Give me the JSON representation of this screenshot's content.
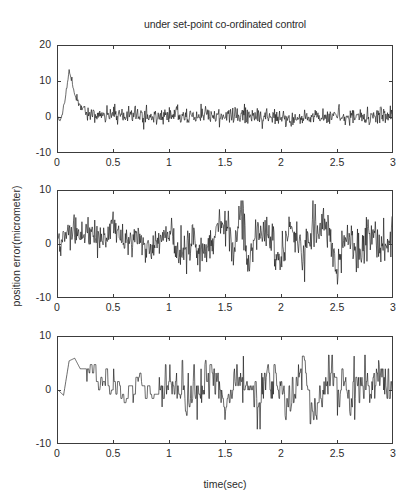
{
  "chart_data": {
    "type": "line",
    "title": "under set-point co-ordinated control",
    "xlabel": "time(sec)",
    "ylabel": "position error(micrometer)",
    "grid": false,
    "legend": "none",
    "xlim": [
      0,
      3
    ],
    "xticks": [
      "0",
      "0.5",
      "1",
      "1.5",
      "2",
      "2.5",
      "3"
    ],
    "xtick_values": [
      0,
      0.5,
      1,
      1.5,
      2,
      2.5,
      3
    ],
    "panels": [
      {
        "index": 1,
        "name": "axis-1",
        "ylim": [
          -10,
          20
        ],
        "yticks": [
          "20",
          "10",
          "0",
          "-10"
        ],
        "ytick_values": [
          20,
          10,
          0,
          -10
        ],
        "description": "initial transient spike to about 13 micrometer near t=0.1 s, decaying to low-amplitude noise about 0 with range roughly -3 to +3",
        "series": [
          {
            "name": "position error axis 1",
            "peak_value": 13,
            "peak_time": 0.1,
            "steady_mean": 0,
            "steady_band": [
              -3,
              3
            ],
            "x": [
              0,
              0.02,
              0.04,
              0.06,
              0.08,
              0.1,
              0.12,
              0.14,
              0.16,
              0.18,
              0.2,
              0.25,
              0.3,
              0.4,
              0.5,
              0.6,
              0.7,
              0.8,
              0.9,
              1.0,
              1.1,
              1.2,
              1.3,
              1.4,
              1.5,
              1.6,
              1.7,
              1.8,
              1.9,
              2.0,
              2.1,
              2.2,
              2.3,
              2.4,
              2.5,
              2.6,
              2.7,
              2.8,
              2.9,
              3.0
            ],
            "values": [
              0,
              -1.5,
              1.0,
              4.5,
              8.5,
              13.0,
              10.5,
              8.0,
              6.0,
              4.5,
              3.0,
              1.0,
              0.5,
              0.2,
              0.6,
              0.1,
              0.8,
              0.0,
              0.4,
              0.3,
              0.7,
              -0.2,
              0.5,
              0.1,
              0.9,
              -0.1,
              0.4,
              -0.6,
              -0.3,
              -0.8,
              -0.2,
              -0.4,
              0.2,
              -0.5,
              0.6,
              -0.3,
              0.1,
              -0.4,
              1.2,
              0.3
            ]
          }
        ]
      },
      {
        "index": 2,
        "name": "axis-2",
        "ylim": [
          -10,
          10
        ],
        "yticks": [
          "10",
          "0",
          "-10"
        ],
        "ytick_values": [
          10,
          0,
          -10
        ],
        "description": "broadband noise about 0 micrometer, amplitude growing from roughly +/-3 early to roughly +/-5 after t=1.2 s, with a tall spike near t=1.65 s reaching about 8",
        "series": [
          {
            "name": "position error axis 2",
            "mean": 0,
            "early_band": [
              -3,
              3
            ],
            "late_band": [
              -5,
              5
            ],
            "spike_value": 8,
            "spike_time": 1.65,
            "x": [
              0,
              0.1,
              0.2,
              0.3,
              0.4,
              0.5,
              0.6,
              0.7,
              0.8,
              0.9,
              1.0,
              1.1,
              1.2,
              1.3,
              1.4,
              1.5,
              1.6,
              1.65,
              1.7,
              1.8,
              1.9,
              2.0,
              2.1,
              2.2,
              2.3,
              2.4,
              2.5,
              2.6,
              2.7,
              2.8,
              2.9,
              3.0
            ],
            "values": [
              0,
              3.0,
              1.5,
              2.0,
              1.0,
              2.5,
              0.5,
              1.5,
              -1.0,
              1.0,
              2.0,
              -1.5,
              0.5,
              -2.0,
              1.0,
              3.0,
              -1.0,
              8.0,
              -4.0,
              2.0,
              1.0,
              -2.5,
              3.5,
              -3.0,
              2.0,
              4.0,
              -5.0,
              1.5,
              -2.0,
              3.0,
              -1.0,
              0.5
            ]
          }
        ]
      },
      {
        "index": 3,
        "name": "axis-3",
        "ylim": [
          -10,
          10
        ],
        "yticks": [
          "10",
          "0",
          "-10"
        ],
        "ytick_values": [
          10,
          0,
          -10
        ],
        "description": "quantized stepped signal, initial step up to about 6 micrometer near t=0.1 s, then stepped noise about 0 with range roughly -7 to +6",
        "series": [
          {
            "name": "position error axis 3",
            "initial_step_value": 6,
            "initial_step_time": 0.12,
            "mean": 0,
            "band": [
              -7,
              6
            ],
            "x": [
              0,
              0.05,
              0.1,
              0.15,
              0.2,
              0.3,
              0.4,
              0.5,
              0.6,
              0.7,
              0.8,
              0.9,
              1.0,
              1.1,
              1.2,
              1.3,
              1.4,
              1.5,
              1.6,
              1.7,
              1.8,
              1.9,
              2.0,
              2.1,
              2.2,
              2.3,
              2.4,
              2.5,
              2.6,
              2.7,
              2.8,
              2.9,
              3.0
            ],
            "values": [
              0,
              -1.0,
              5.5,
              6.0,
              4.0,
              4.0,
              0.5,
              1.0,
              -1.0,
              1.0,
              0.5,
              -1.5,
              2.0,
              0.0,
              -2.0,
              1.0,
              3.0,
              -4.0,
              2.0,
              1.0,
              -3.0,
              2.5,
              1.0,
              -2.0,
              4.0,
              -5.0,
              1.0,
              2.0,
              -1.0,
              1.5,
              0.5,
              2.0,
              1.0
            ]
          }
        ]
      }
    ]
  }
}
